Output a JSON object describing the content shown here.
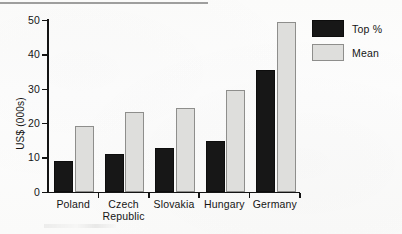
{
  "chart_data": {
    "type": "bar",
    "title": "",
    "subtitle": "",
    "xlabel": "",
    "ylabel": "US$ (000s)",
    "ylim": [
      0,
      50
    ],
    "yticks": [
      0,
      10,
      20,
      30,
      40,
      50
    ],
    "ytick_labels": [
      "0",
      "10",
      "20",
      "30",
      "40",
      "50"
    ],
    "grid": false,
    "legend_position": "top-right",
    "categories": [
      "Poland",
      "Czech\nRepublic",
      "Slovakia",
      "Hungary",
      "Germany"
    ],
    "series": [
      {
        "name": "Top %",
        "color": "#171717",
        "values": [
          9,
          11,
          12.8,
          14.8,
          35.5
        ]
      },
      {
        "name": "Mean",
        "color": "#dededc",
        "values": [
          19,
          23.2,
          24.4,
          29.5,
          49.5
        ]
      }
    ]
  },
  "legend": {
    "items": [
      {
        "label": "Top %",
        "swatch": "black-swatch"
      },
      {
        "label": "Mean",
        "swatch": "gray-swatch"
      }
    ]
  },
  "axis": {
    "y_title": "US$ (000s)"
  }
}
